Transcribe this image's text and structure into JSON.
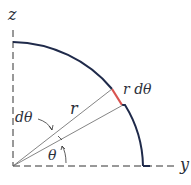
{
  "diagram": {
    "axes": {
      "vertical": "z",
      "horizontal": "y"
    },
    "labels": {
      "radius": "r",
      "arc_element": "r dθ",
      "angle": "θ",
      "angle_increment": "dθ"
    },
    "caption": "",
    "colors": {
      "arc": "#1f2a4a",
      "arc_element": "#d9534f",
      "axes": "#333333",
      "rays": "#555555",
      "text": "#2b2f3a"
    }
  }
}
